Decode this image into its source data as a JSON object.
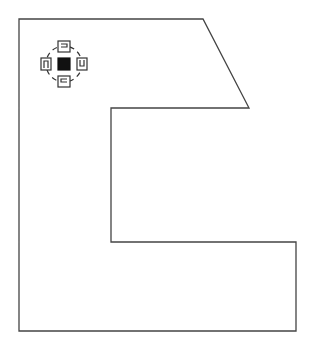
{
  "diagram": {
    "type": "polygon-outline",
    "stroke_color": "#444444",
    "background": "#ffffff",
    "shape": {
      "name": "c-shaped-room-outline",
      "points": [
        [
          19,
          19
        ],
        [
          203,
          19
        ],
        [
          249,
          108
        ],
        [
          111,
          108
        ],
        [
          111,
          242
        ],
        [
          296,
          242
        ],
        [
          296,
          331
        ],
        [
          19,
          331
        ]
      ]
    },
    "icon": {
      "name": "rotation-symmetry-icon",
      "center": [
        64,
        64
      ],
      "fill_color": "#111111",
      "orientations": [
        "top",
        "right",
        "bottom",
        "left"
      ]
    }
  }
}
